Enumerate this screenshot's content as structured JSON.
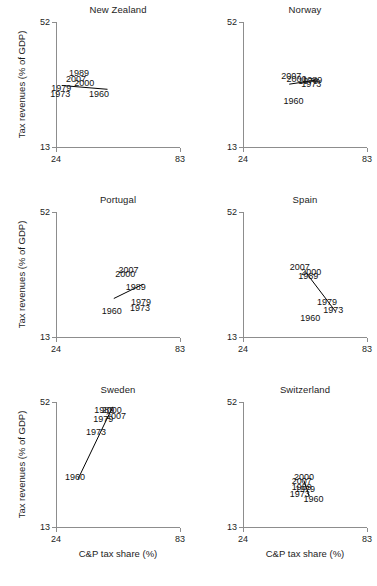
{
  "figure": {
    "axis_titles": {
      "y": "Tax revenues (% of GDP)",
      "x": "C&P tax share (%)"
    },
    "x_ticks": [
      "24",
      "83"
    ],
    "y_ticks": [
      "52",
      "13"
    ],
    "xlim": [
      24,
      83
    ],
    "ylim": [
      13,
      52
    ]
  },
  "chart_data": {
    "type": "scatter",
    "title": "",
    "xlabel": "C&P tax share (%)",
    "ylabel": "Tax revenues (% of GDP)",
    "xlim": [
      24,
      83
    ],
    "ylim": [
      13,
      52
    ],
    "grid": false,
    "legend": "none",
    "point_label_field": "year",
    "panels": [
      {
        "name": "New Zealand",
        "points": [
          {
            "year": "1989",
            "x": 35.0,
            "y": 36.0
          },
          {
            "year": "2007",
            "x": 33.5,
            "y": 34.2
          },
          {
            "year": "2000",
            "x": 37.5,
            "y": 33.0
          },
          {
            "year": "1979",
            "x": 26.5,
            "y": 31.3
          },
          {
            "year": "1973",
            "x": 26.0,
            "y": 29.4
          },
          {
            "year": "1960",
            "x": 44.5,
            "y": 29.4
          }
        ],
        "line": [
          {
            "x": 26.8,
            "y": 32.2
          },
          {
            "x": 48.5,
            "y": 31.0
          }
        ]
      },
      {
        "name": "Norway",
        "points": [
          {
            "year": "2007",
            "x": 47.0,
            "y": 35.0
          },
          {
            "year": "2000",
            "x": 49.5,
            "y": 34.3
          },
          {
            "year": "1989",
            "x": 57.0,
            "y": 33.8
          },
          {
            "year": "1979",
            "x": 55.0,
            "y": 33.6
          },
          {
            "year": "1973",
            "x": 56.5,
            "y": 32.6
          },
          {
            "year": "1960",
            "x": 48.0,
            "y": 27.5
          }
        ],
        "line": [
          {
            "x": 46.0,
            "y": 32.6
          },
          {
            "x": 60.0,
            "y": 34.0
          }
        ]
      },
      {
        "name": "Portugal",
        "points": [
          {
            "year": "2007",
            "x": 58.5,
            "y": 34.0
          },
          {
            "year": "2000",
            "x": 57.0,
            "y": 32.6
          },
          {
            "year": "1989",
            "x": 62.0,
            "y": 28.5
          },
          {
            "year": "1979",
            "x": 64.5,
            "y": 24.0
          },
          {
            "year": "1973",
            "x": 64.0,
            "y": 21.9
          },
          {
            "year": "1960",
            "x": 50.5,
            "y": 21.0
          }
        ],
        "line": [
          {
            "x": 51.5,
            "y": 25.0
          },
          {
            "x": 65.5,
            "y": 29.5
          }
        ]
      },
      {
        "name": "Spain",
        "points": [
          {
            "year": "2007",
            "x": 51.0,
            "y": 34.8
          },
          {
            "year": "2000",
            "x": 56.5,
            "y": 33.2
          },
          {
            "year": "1989",
            "x": 55.0,
            "y": 32.0
          },
          {
            "year": "1979",
            "x": 64.0,
            "y": 24.0
          },
          {
            "year": "1973",
            "x": 67.0,
            "y": 21.4
          },
          {
            "year": "1960",
            "x": 56.0,
            "y": 18.8
          }
        ],
        "line": [
          {
            "x": 53.5,
            "y": 33.5
          },
          {
            "x": 68.0,
            "y": 21.0
          }
        ]
      },
      {
        "name": "Sweden",
        "points": [
          {
            "year": "1989",
            "x": 47.0,
            "y": 49.5
          },
          {
            "year": "2000",
            "x": 50.5,
            "y": 49.5
          },
          {
            "year": "2007",
            "x": 52.5,
            "y": 47.6
          },
          {
            "year": "1979",
            "x": 46.5,
            "y": 46.8
          },
          {
            "year": "1973",
            "x": 43.0,
            "y": 42.5
          },
          {
            "year": "1960",
            "x": 33.0,
            "y": 28.5
          }
        ],
        "line": [
          {
            "x": 34.5,
            "y": 28.0
          },
          {
            "x": 51.0,
            "y": 50.5
          }
        ]
      },
      {
        "name": "Switzerland",
        "points": [
          {
            "year": "2000",
            "x": 53.0,
            "y": 28.6
          },
          {
            "year": "2007",
            "x": 52.0,
            "y": 27.5
          },
          {
            "year": "1989",
            "x": 52.0,
            "y": 25.4
          },
          {
            "year": "1979",
            "x": 53.5,
            "y": 25.0
          },
          {
            "year": "1973",
            "x": 51.0,
            "y": 23.2
          },
          {
            "year": "1960",
            "x": 57.5,
            "y": 21.8
          }
        ],
        "line": [
          {
            "x": 53.0,
            "y": 27.5
          },
          {
            "x": 55.5,
            "y": 22.6
          }
        ]
      }
    ]
  }
}
